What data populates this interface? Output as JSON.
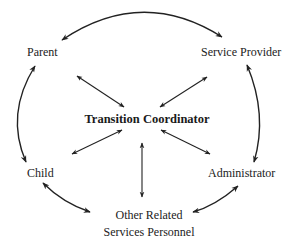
{
  "diagram": {
    "center": {
      "label": "Transition Coordinator"
    },
    "nodes": [
      {
        "id": "parent",
        "label": "Parent"
      },
      {
        "id": "service_provider",
        "label": "Service Provider"
      },
      {
        "id": "child",
        "label": "Child"
      },
      {
        "id": "administrator",
        "label": "Administrator"
      },
      {
        "id": "other_related",
        "label_line1": "Other Related",
        "label_line2": "Services Personnel"
      }
    ],
    "edges": [
      {
        "from": "Parent",
        "to": "Service Provider",
        "type": "curved-bidirectional"
      },
      {
        "from": "Service Provider",
        "to": "Administrator",
        "type": "curved-bidirectional"
      },
      {
        "from": "Administrator",
        "to": "Other Related Services Personnel",
        "type": "curved-bidirectional"
      },
      {
        "from": "Other Related Services Personnel",
        "to": "Child",
        "type": "curved-bidirectional"
      },
      {
        "from": "Child",
        "to": "Parent",
        "type": "curved-bidirectional"
      },
      {
        "from": "Transition Coordinator",
        "to": "Parent",
        "type": "straight-bidirectional"
      },
      {
        "from": "Transition Coordinator",
        "to": "Service Provider",
        "type": "straight-bidirectional"
      },
      {
        "from": "Transition Coordinator",
        "to": "Child",
        "type": "straight-bidirectional"
      },
      {
        "from": "Transition Coordinator",
        "to": "Administrator",
        "type": "straight-bidirectional"
      },
      {
        "from": "Transition Coordinator",
        "to": "Other Related Services Personnel",
        "type": "straight-bidirectional"
      }
    ],
    "colors": {
      "line": "#222222",
      "text": "#222222",
      "background": "#ffffff"
    }
  }
}
